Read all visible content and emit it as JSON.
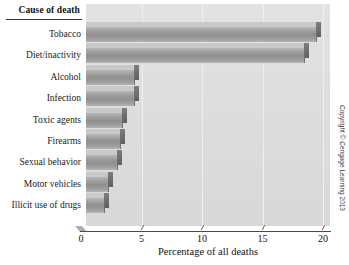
{
  "chart_data": {
    "type": "bar",
    "orientation": "horizontal",
    "title": "",
    "category_axis_header": "Cause of death",
    "xlabel": "Percentage of all deaths",
    "ylabel": "",
    "xlim": [
      0,
      20
    ],
    "xticks": [
      0,
      5,
      10,
      15,
      20
    ],
    "xtick_labels": [
      "0",
      "5",
      "10",
      "15",
      "20"
    ],
    "grid": "vertical gridlines at x ticks",
    "legend": "none",
    "categories": [
      "Tobacco",
      "Diet/inactivity",
      "Alcohol",
      "Infection",
      "Toxic agents",
      "Firearms",
      "Sexual behavior",
      "Motor vehicles",
      "Illicit use of drugs"
    ],
    "values": [
      19,
      18,
      4,
      4,
      3,
      2.8,
      2.6,
      1.8,
      1.5
    ],
    "series": [
      {
        "name": "Percentage of all deaths",
        "values": [
          19,
          18,
          4,
          4,
          3,
          2.8,
          2.6,
          1.8,
          1.5
        ]
      }
    ],
    "style": {
      "bar_color": "#9a9a9a",
      "plot_background": "#dcdcdc",
      "gridline_color": "#efefef",
      "axis_color": "#4a4a4a",
      "three_d": true
    }
  },
  "footer": {
    "copyright": "Copyright © Cengage Learning 2013"
  }
}
